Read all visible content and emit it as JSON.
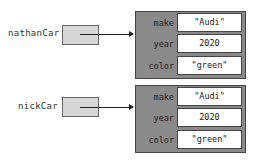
{
  "variables": [
    {
      "name": "nathanCar",
      "object": {
        "fields": [
          {
            "key": "make",
            "value": "\"Audi\""
          },
          {
            "key": "year",
            "value": "2020"
          },
          {
            "key": "color",
            "value": "\"green\""
          }
        ]
      }
    },
    {
      "name": "nickCar",
      "object": {
        "fields": [
          {
            "key": "make",
            "value": "\"Audi\""
          },
          {
            "key": "year",
            "value": "2020"
          },
          {
            "key": "color",
            "value": "\"green\""
          }
        ]
      }
    }
  ],
  "colors": {
    "object_bg": "#8a8a8a",
    "variable_box": "#d6d6d6",
    "value_cell": "#ffffff"
  }
}
